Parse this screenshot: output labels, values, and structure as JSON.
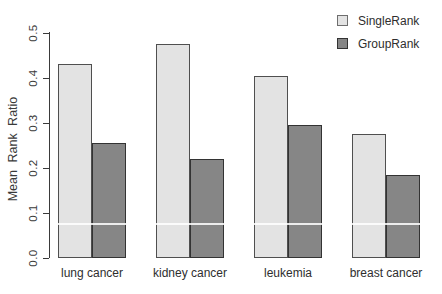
{
  "figure": {
    "background": "#ffffff",
    "y_axis_title": "Mean Rank Ratio"
  },
  "legend": {
    "items": [
      {
        "label": "SingleRank",
        "color": "#e3e3e3"
      },
      {
        "label": "GroupRank",
        "color": "#868686"
      }
    ],
    "position": "top-right"
  },
  "chart_data": {
    "type": "bar",
    "title": "",
    "xlabel": "",
    "ylabel": "Mean Rank Ratio",
    "categories": [
      "lung cancer",
      "kidney cancer",
      "leukemia",
      "breast cancer"
    ],
    "series": [
      {
        "name": "SingleRank",
        "color": "#e3e3e3",
        "values": [
          0.43,
          0.475,
          0.405,
          0.275
        ]
      },
      {
        "name": "GroupRank",
        "color": "#868686",
        "values": [
          0.255,
          0.22,
          0.295,
          0.185
        ]
      }
    ],
    "ylim": [
      0.0,
      0.5
    ],
    "yticks": [
      "0.0",
      "0.1",
      "0.2",
      "0.3",
      "0.4",
      "0.5"
    ],
    "grid": false,
    "legend_position": "top-right",
    "bar_edge_color": "#4f4f4f"
  }
}
